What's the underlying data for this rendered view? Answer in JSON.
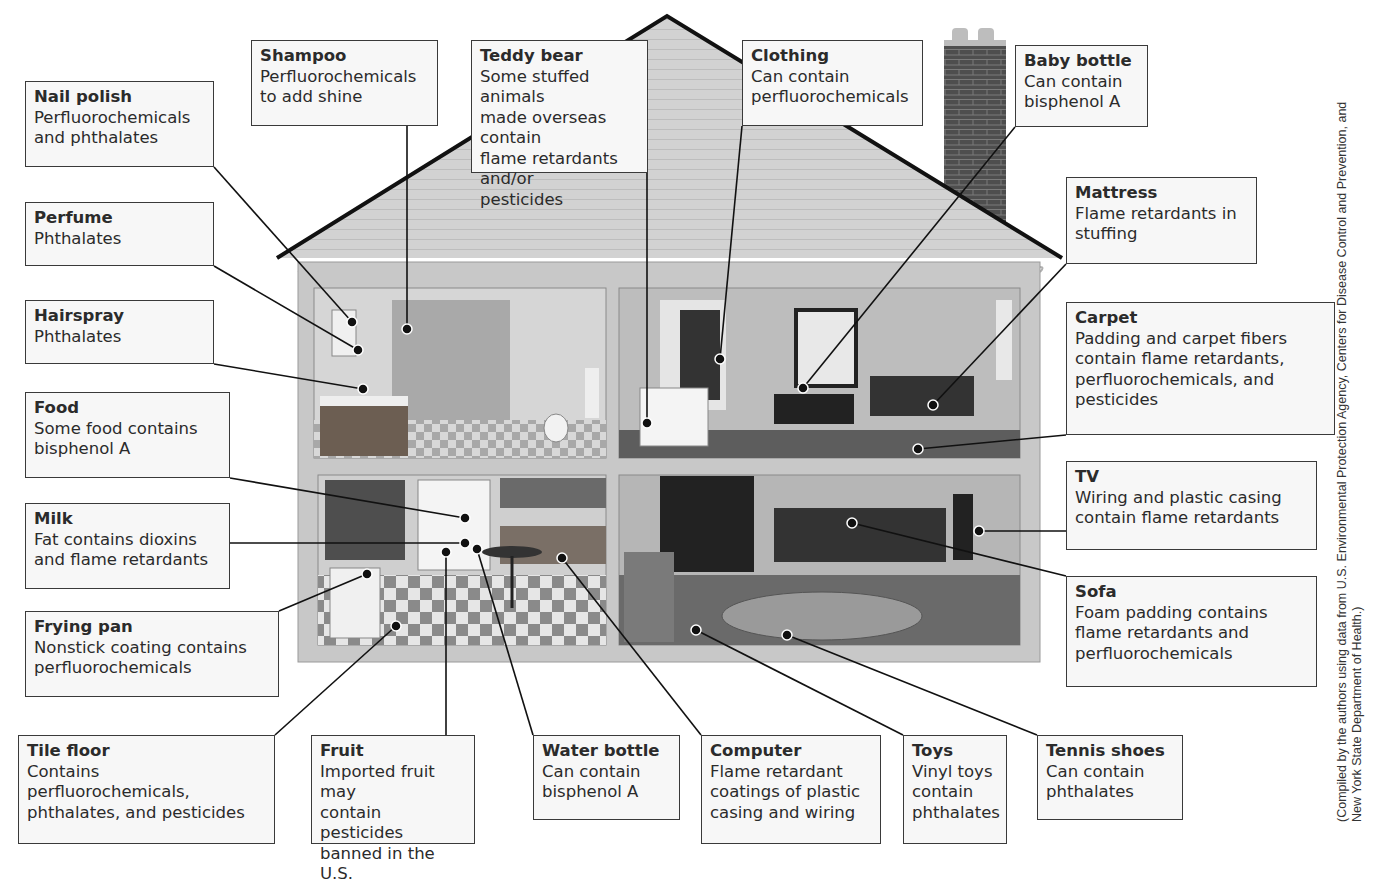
{
  "figure": {
    "credit": "(Compiled by the authors using data from U.S. Environmental Protection Agency, Centers for Disease Control and Prevention, and\nNew York State Department of Health.)"
  },
  "colors": {
    "label_fill": "#f7f7f7",
    "label_border": "#3a3a3a",
    "roof": "#cfcfcf",
    "wall": "#c8c8c8",
    "chimney": "#555555",
    "leader": "#111111"
  },
  "labels": [
    {
      "id": "nail-polish",
      "title": "Nail polish",
      "desc": "Perfluorochemicals\nand phthalates",
      "box": [
        25,
        81,
        189,
        86
      ],
      "target": [
        352,
        322
      ]
    },
    {
      "id": "perfume",
      "title": "Perfume",
      "desc": "Phthalates",
      "box": [
        25,
        202,
        189,
        64
      ],
      "target": [
        358,
        350
      ]
    },
    {
      "id": "hairspray",
      "title": "Hairspray",
      "desc": "Phthalates",
      "box": [
        25,
        300,
        189,
        64
      ],
      "target": [
        363,
        389
      ]
    },
    {
      "id": "food",
      "title": "Food",
      "desc": "Some food contains\nbisphenol A",
      "box": [
        25,
        392,
        205,
        86
      ],
      "target": [
        465,
        518
      ]
    },
    {
      "id": "milk",
      "title": "Milk",
      "desc": "Fat contains dioxins\nand flame retardants",
      "box": [
        25,
        503,
        205,
        86
      ],
      "target": [
        465,
        543
      ]
    },
    {
      "id": "frying-pan",
      "title": "Frying pan",
      "desc": "Nonstick coating contains\nperfluorochemicals",
      "box": [
        25,
        611,
        254,
        86
      ],
      "target": [
        367,
        574
      ]
    },
    {
      "id": "shampoo",
      "title": "Shampoo",
      "desc": "Perfluorochemicals\nto add shine",
      "box": [
        251,
        40,
        187,
        86
      ],
      "target": [
        407,
        329
      ]
    },
    {
      "id": "teddy-bear",
      "title": "Teddy bear",
      "desc": "Some stuffed animals\nmade overseas contain\nflame retardants and/or\npesticides",
      "box": [
        471,
        40,
        177,
        133
      ],
      "target": [
        647,
        423
      ]
    },
    {
      "id": "clothing",
      "title": "Clothing",
      "desc": "Can contain\nperfluorochemicals",
      "box": [
        742,
        40,
        181,
        86
      ],
      "target": [
        720,
        359
      ]
    },
    {
      "id": "baby-bottle",
      "title": "Baby bottle",
      "desc": "Can contain\nbisphenol A",
      "box": [
        1015,
        45,
        133,
        82
      ],
      "target": [
        803,
        388
      ]
    },
    {
      "id": "mattress",
      "title": "Mattress",
      "desc": "Flame retardants in\nstuffing",
      "box": [
        1066,
        177,
        191,
        87
      ],
      "target": [
        933,
        405
      ]
    },
    {
      "id": "carpet",
      "title": "Carpet",
      "desc": "Padding and carpet fibers\ncontain flame retardants,\nperfluorochemicals, and\npesticides",
      "box": [
        1066,
        302,
        269,
        133
      ],
      "target": [
        918,
        449
      ]
    },
    {
      "id": "tv",
      "title": "TV",
      "desc": "Wiring and plastic casing\ncontain flame retardants",
      "box": [
        1066,
        461,
        251,
        89
      ],
      "target": [
        979,
        531
      ]
    },
    {
      "id": "sofa",
      "title": "Sofa",
      "desc": "Foam padding contains\nflame retardants and\nperfluorochemicals",
      "box": [
        1066,
        576,
        251,
        111
      ],
      "target": [
        852,
        523
      ]
    },
    {
      "id": "tile-floor",
      "title": "Tile floor",
      "desc": "Contains\nperfluorochemicals,\nphthalates, and pesticides",
      "box": [
        18,
        735,
        257,
        109
      ],
      "target": [
        396,
        626
      ]
    },
    {
      "id": "fruit",
      "title": "Fruit",
      "desc": "Imported fruit may\ncontain pesticides\nbanned in the U.S.",
      "box": [
        311,
        735,
        164,
        109
      ],
      "target": [
        446,
        552
      ]
    },
    {
      "id": "water-bottle",
      "title": "Water bottle",
      "desc": "Can contain\nbisphenol A",
      "box": [
        533,
        735,
        147,
        85
      ],
      "target": [
        477,
        549
      ]
    },
    {
      "id": "computer",
      "title": "Computer",
      "desc": "Flame retardant\ncoatings of plastic\ncasing and wiring",
      "box": [
        701,
        735,
        180,
        109
      ],
      "target": [
        562,
        558
      ]
    },
    {
      "id": "toys",
      "title": "Toys",
      "desc": "Vinyl toys\ncontain\nphthalates",
      "box": [
        903,
        735,
        104,
        109
      ],
      "target": [
        696,
        630
      ]
    },
    {
      "id": "tennis-shoes",
      "title": "Tennis shoes",
      "desc": "Can contain\nphthalates",
      "box": [
        1037,
        735,
        146,
        85
      ],
      "target": [
        787,
        635
      ]
    }
  ]
}
